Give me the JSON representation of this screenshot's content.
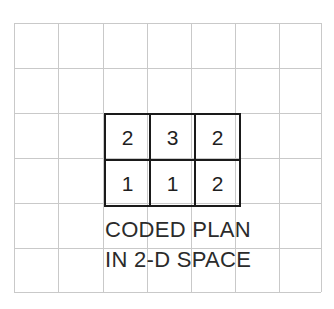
{
  "figure": {
    "width": 334,
    "height": 309,
    "background_color": "#ffffff"
  },
  "background_grid": {
    "name": "graph-paper-grid",
    "line_color": "#c9c9c9",
    "columns": 7,
    "rows": 6,
    "cell_size": 44.5,
    "x_positions": [
      14,
      58,
      103,
      147,
      191,
      235,
      279,
      321
    ],
    "y_positions": [
      23,
      68,
      113,
      158,
      203,
      248,
      292
    ]
  },
  "coded_plan": {
    "name": "coded-plan-table",
    "border_color": "#1a1a1a",
    "text_color": "#1f1f1f",
    "left": 104,
    "top": 113,
    "rows": [
      [
        "2",
        "3",
        "2"
      ],
      [
        "1",
        "1",
        "2"
      ]
    ]
  },
  "caption": {
    "color": "#2b2b2b",
    "lines": [
      "CODED PLAN",
      "IN 2-D SPACE"
    ]
  }
}
